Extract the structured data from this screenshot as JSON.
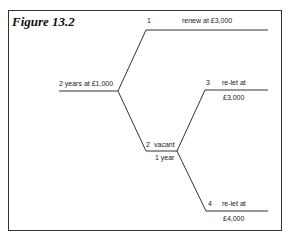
{
  "figure": {
    "title": "Figure 13.2"
  },
  "tree": {
    "root": {
      "label": "2 years at £1,000"
    },
    "branches": [
      {
        "number": "1",
        "label": "renew at £3,000"
      },
      {
        "number": "2",
        "label": "vacant",
        "sublabel": "1 year"
      },
      {
        "number": "3",
        "label": "re-let at",
        "value": "£3,000"
      },
      {
        "number": "4",
        "label": "re-let at",
        "value": "£4,000"
      }
    ]
  }
}
